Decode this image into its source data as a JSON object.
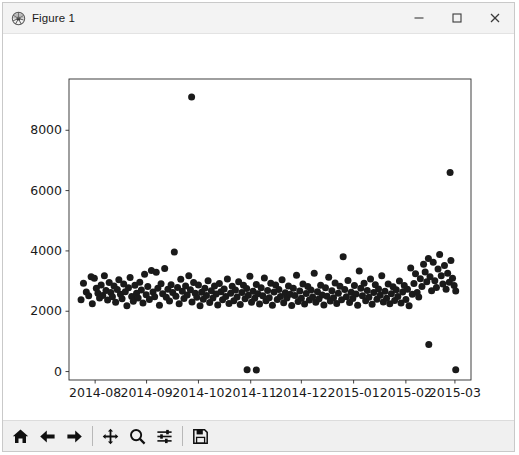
{
  "window": {
    "title": "Figure 1",
    "icon": "matplotlib-logo-icon",
    "controls": {
      "minimize": "−",
      "maximize": "□",
      "close": "×"
    }
  },
  "toolbar": {
    "buttons": [
      {
        "name": "home-button",
        "label": "Home",
        "icon": "home-icon"
      },
      {
        "name": "back-button",
        "label": "Back",
        "icon": "arrow-left-icon"
      },
      {
        "name": "forward-button",
        "label": "Forward",
        "icon": "arrow-right-icon"
      },
      {
        "name": "pan-button",
        "label": "Pan",
        "icon": "move-icon"
      },
      {
        "name": "zoom-button",
        "label": "Zoom",
        "icon": "magnifier-icon"
      },
      {
        "name": "configure-subplots-button",
        "label": "Configure subplots",
        "icon": "sliders-icon"
      },
      {
        "name": "save-button",
        "label": "Save",
        "icon": "floppy-disk-icon"
      }
    ],
    "message": ""
  },
  "chart_data": {
    "type": "scatter",
    "title": "",
    "xlabel": "",
    "ylabel": "",
    "grid": false,
    "legend": null,
    "marker": {
      "shape": "circle",
      "color": "#1a1a1a",
      "size_px": 7
    },
    "facecolor": "#ffffff",
    "xtick_labels": [
      "2014-08",
      "2014-09",
      "2014-10",
      "2014-11",
      "2014-12",
      "2015-01",
      "2015-02",
      "2015-03"
    ],
    "xtick_values": [
      0.065,
      0.193,
      0.322,
      0.452,
      0.578,
      0.708,
      0.838,
      0.96
    ],
    "ytick_labels": [
      "0",
      "2000",
      "4000",
      "6000",
      "8000"
    ],
    "ytick_values": [
      0,
      2000,
      4000,
      6000,
      8000
    ],
    "xlim": [
      0,
      1
    ],
    "ylim": [
      -280,
      9700
    ],
    "points": [
      [
        0.03,
        2380
      ],
      [
        0.036,
        2930
      ],
      [
        0.043,
        2640
      ],
      [
        0.049,
        2510
      ],
      [
        0.055,
        3140
      ],
      [
        0.058,
        2250
      ],
      [
        0.063,
        3090
      ],
      [
        0.068,
        2760
      ],
      [
        0.072,
        2600
      ],
      [
        0.076,
        2440
      ],
      [
        0.08,
        2870
      ],
      [
        0.084,
        2520
      ],
      [
        0.088,
        3180
      ],
      [
        0.092,
        2690
      ],
      [
        0.096,
        2370
      ],
      [
        0.1,
        2950
      ],
      [
        0.104,
        2620
      ],
      [
        0.108,
        2480
      ],
      [
        0.112,
        2840
      ],
      [
        0.116,
        2300
      ],
      [
        0.12,
        2720
      ],
      [
        0.124,
        3040
      ],
      [
        0.128,
        2560
      ],
      [
        0.132,
        2410
      ],
      [
        0.136,
        2900
      ],
      [
        0.14,
        2650
      ],
      [
        0.144,
        2180
      ],
      [
        0.148,
        2780
      ],
      [
        0.152,
        3120
      ],
      [
        0.156,
        2490
      ],
      [
        0.16,
        2330
      ],
      [
        0.164,
        2860
      ],
      [
        0.168,
        2600
      ],
      [
        0.172,
        2440
      ],
      [
        0.176,
        2960
      ],
      [
        0.18,
        2700
      ],
      [
        0.184,
        2270
      ],
      [
        0.188,
        3230
      ],
      [
        0.192,
        2550
      ],
      [
        0.196,
        2820
      ],
      [
        0.2,
        2390
      ],
      [
        0.205,
        3350
      ],
      [
        0.209,
        2640
      ],
      [
        0.213,
        2480
      ],
      [
        0.217,
        3290
      ],
      [
        0.221,
        2760
      ],
      [
        0.225,
        2200
      ],
      [
        0.229,
        2910
      ],
      [
        0.233,
        2580
      ],
      [
        0.238,
        3420
      ],
      [
        0.242,
        2460
      ],
      [
        0.246,
        2730
      ],
      [
        0.25,
        2340
      ],
      [
        0.254,
        2880
      ],
      [
        0.258,
        2620
      ],
      [
        0.262,
        3960
      ],
      [
        0.266,
        2500
      ],
      [
        0.27,
        2790
      ],
      [
        0.274,
        2250
      ],
      [
        0.278,
        3060
      ],
      [
        0.282,
        2660
      ],
      [
        0.286,
        2420
      ],
      [
        0.29,
        2840
      ],
      [
        0.294,
        2540
      ],
      [
        0.298,
        3180
      ],
      [
        0.302,
        2710
      ],
      [
        0.306,
        2310
      ],
      [
        0.31,
        2950
      ],
      [
        0.314,
        2600
      ],
      [
        0.318,
        2460
      ],
      [
        0.305,
        9100
      ],
      [
        0.322,
        2870
      ],
      [
        0.326,
        2180
      ],
      [
        0.33,
        2630
      ],
      [
        0.334,
        2400
      ],
      [
        0.338,
        2760
      ],
      [
        0.342,
        2520
      ],
      [
        0.346,
        3010
      ],
      [
        0.35,
        2290
      ],
      [
        0.354,
        2680
      ],
      [
        0.358,
        2440
      ],
      [
        0.362,
        2840
      ],
      [
        0.366,
        2570
      ],
      [
        0.37,
        2210
      ],
      [
        0.374,
        2920
      ],
      [
        0.378,
        2650
      ],
      [
        0.382,
        2380
      ],
      [
        0.386,
        2740
      ],
      [
        0.39,
        2490
      ],
      [
        0.394,
        3070
      ],
      [
        0.398,
        2260
      ],
      [
        0.402,
        2600
      ],
      [
        0.406,
        2830
      ],
      [
        0.41,
        2350
      ],
      [
        0.414,
        2700
      ],
      [
        0.418,
        2470
      ],
      [
        0.422,
        2980
      ],
      [
        0.426,
        2220
      ],
      [
        0.43,
        2620
      ],
      [
        0.434,
        2860
      ],
      [
        0.438,
        2410
      ],
      [
        0.442,
        2750
      ],
      [
        0.446,
        2530
      ],
      [
        0.45,
        3160
      ],
      [
        0.454,
        2300
      ],
      [
        0.458,
        2660
      ],
      [
        0.462,
        2430
      ],
      [
        0.466,
        2890
      ],
      [
        0.47,
        2580
      ],
      [
        0.474,
        2240
      ],
      [
        0.478,
        2780
      ],
      [
        0.443,
        60
      ],
      [
        0.466,
        55
      ],
      [
        0.482,
        2510
      ],
      [
        0.486,
        3100
      ],
      [
        0.49,
        2350
      ],
      [
        0.494,
        2690
      ],
      [
        0.498,
        2450
      ],
      [
        0.502,
        2930
      ],
      [
        0.506,
        2200
      ],
      [
        0.51,
        2640
      ],
      [
        0.514,
        2870
      ],
      [
        0.518,
        2390
      ],
      [
        0.522,
        2720
      ],
      [
        0.526,
        2490
      ],
      [
        0.53,
        3040
      ],
      [
        0.534,
        2280
      ],
      [
        0.538,
        2610
      ],
      [
        0.542,
        2440
      ],
      [
        0.546,
        2840
      ],
      [
        0.55,
        2560
      ],
      [
        0.554,
        2190
      ],
      [
        0.558,
        2760
      ],
      [
        0.562,
        2520
      ],
      [
        0.566,
        3190
      ],
      [
        0.57,
        2320
      ],
      [
        0.574,
        2670
      ],
      [
        0.578,
        2430
      ],
      [
        0.582,
        2900
      ],
      [
        0.586,
        2240
      ],
      [
        0.59,
        2590
      ],
      [
        0.594,
        2820
      ],
      [
        0.598,
        2370
      ],
      [
        0.602,
        2700
      ],
      [
        0.606,
        2470
      ],
      [
        0.61,
        3260
      ],
      [
        0.614,
        2300
      ],
      [
        0.618,
        2650
      ],
      [
        0.622,
        2410
      ],
      [
        0.626,
        2860
      ],
      [
        0.63,
        2540
      ],
      [
        0.634,
        2210
      ],
      [
        0.638,
        2780
      ],
      [
        0.642,
        2500
      ],
      [
        0.646,
        3130
      ],
      [
        0.65,
        2340
      ],
      [
        0.654,
        2680
      ],
      [
        0.658,
        2450
      ],
      [
        0.662,
        2940
      ],
      [
        0.666,
        2260
      ],
      [
        0.67,
        2600
      ],
      [
        0.674,
        2830
      ],
      [
        0.678,
        2380
      ],
      [
        0.682,
        3810
      ],
      [
        0.686,
        2720
      ],
      [
        0.69,
        2480
      ],
      [
        0.694,
        3020
      ],
      [
        0.698,
        2290
      ],
      [
        0.702,
        2630
      ],
      [
        0.706,
        2420
      ],
      [
        0.71,
        2850
      ],
      [
        0.714,
        2570
      ],
      [
        0.718,
        2200
      ],
      [
        0.722,
        3330
      ],
      [
        0.726,
        2760
      ],
      [
        0.73,
        2510
      ],
      [
        0.734,
        2930
      ],
      [
        0.738,
        2350
      ],
      [
        0.742,
        2690
      ],
      [
        0.746,
        2460
      ],
      [
        0.75,
        3070
      ],
      [
        0.754,
        2230
      ],
      [
        0.758,
        2620
      ],
      [
        0.762,
        2880
      ],
      [
        0.766,
        2400
      ],
      [
        0.77,
        2740
      ],
      [
        0.774,
        2530
      ],
      [
        0.778,
        3180
      ],
      [
        0.782,
        2310
      ],
      [
        0.786,
        2660
      ],
      [
        0.79,
        2430
      ],
      [
        0.794,
        2900
      ],
      [
        0.798,
        2250
      ],
      [
        0.802,
        2580
      ],
      [
        0.806,
        2810
      ],
      [
        0.81,
        2360
      ],
      [
        0.814,
        2710
      ],
      [
        0.818,
        2490
      ],
      [
        0.822,
        3000
      ],
      [
        0.826,
        2270
      ],
      [
        0.83,
        2640
      ],
      [
        0.834,
        2850
      ],
      [
        0.838,
        2390
      ],
      [
        0.842,
        2730
      ],
      [
        0.846,
        2180
      ],
      [
        0.85,
        3430
      ],
      [
        0.854,
        2560
      ],
      [
        0.858,
        2920
      ],
      [
        0.862,
        3240
      ],
      [
        0.866,
        2620
      ],
      [
        0.87,
        2470
      ],
      [
        0.874,
        3080
      ],
      [
        0.878,
        2820
      ],
      [
        0.882,
        3560
      ],
      [
        0.886,
        3300
      ],
      [
        0.89,
        2980
      ],
      [
        0.894,
        3750
      ],
      [
        0.898,
        3140
      ],
      [
        0.902,
        2680
      ],
      [
        0.906,
        3620
      ],
      [
        0.91,
        3010
      ],
      [
        0.914,
        2790
      ],
      [
        0.918,
        3400
      ],
      [
        0.922,
        3880
      ],
      [
        0.926,
        3180
      ],
      [
        0.93,
        2900
      ],
      [
        0.934,
        3520
      ],
      [
        0.938,
        2730
      ],
      [
        0.942,
        3260
      ],
      [
        0.946,
        2960
      ],
      [
        0.95,
        3680
      ],
      [
        0.954,
        3090
      ],
      [
        0.958,
        2850
      ],
      [
        0.962,
        2670
      ],
      [
        0.895,
        900
      ],
      [
        0.948,
        6600
      ],
      [
        0.962,
        60
      ]
    ]
  }
}
